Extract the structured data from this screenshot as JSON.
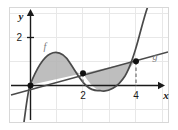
{
  "figure": {
    "title": "",
    "axes": {
      "x_label": "x",
      "y_label": "y",
      "x_ticks": [
        {
          "value": 2,
          "label": "2"
        },
        {
          "value": 4,
          "label": "4"
        }
      ],
      "y_ticks": [
        {
          "value": 2,
          "label": "2"
        }
      ],
      "xlim": [
        -1.1,
        5.6
      ],
      "ylim": [
        -1.8,
        3.3
      ],
      "grid": true,
      "grid_color": "#e6e6e6",
      "axis_color": "#1a1a1a"
    },
    "curves": [
      {
        "name": "f",
        "label": "f",
        "type": "cubic",
        "color": "#555555",
        "label_position": {
          "x": 0.55,
          "y": 1.75
        },
        "description": "cubic through 0, 2 and 4 with local max near x=1 and local min near x=3"
      },
      {
        "name": "g",
        "label": "g",
        "type": "line",
        "color": "#555555",
        "label_position": {
          "x": 4.85,
          "y": 1.3
        },
        "description": "straight line through origin with positive slope"
      }
    ],
    "intersections": [
      {
        "x": 0,
        "y": 0,
        "marked": false
      },
      {
        "x": 2,
        "y": 1,
        "marked": true
      },
      {
        "x": 4,
        "y": 2,
        "marked": true
      }
    ],
    "dashed_guides": [
      {
        "x": 2
      },
      {
        "x": 4
      }
    ],
    "shaded_regions": [
      {
        "from": 0,
        "to": 2,
        "between": [
          "f",
          "g"
        ],
        "upper": "f",
        "fill": "#b4b4b4"
      },
      {
        "from": 2,
        "to": 4,
        "between": [
          "g",
          "f"
        ],
        "upper": "g",
        "fill": "#b4b4b4"
      }
    ],
    "shade_color": "#b3b3b3",
    "background": "#ffffff",
    "border_color": "#d8d8d8"
  }
}
